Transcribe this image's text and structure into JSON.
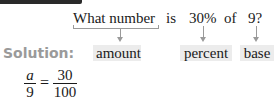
{
  "question": {
    "words": [
      "What number",
      "is",
      "30%",
      "of",
      "9?"
    ]
  },
  "solution": {
    "label": "Solution:",
    "terms": [
      "amount",
      "percent",
      "base"
    ]
  },
  "equation": {
    "left_numerator": "a",
    "left_denominator": "9",
    "operator": "=",
    "right_numerator": "30",
    "right_denominator": "100"
  },
  "colors": {
    "label_gray": "#9a9a9a",
    "box_fill": "#ececec",
    "text": "#1a1a1a",
    "top_bar": "#2a2a2a"
  }
}
